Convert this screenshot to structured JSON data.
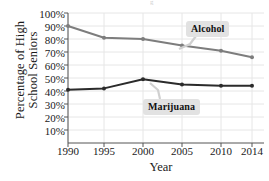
{
  "figure": {
    "top_artifact": "g",
    "background": "#ffffff"
  },
  "chart_data": {
    "type": "line",
    "title": "",
    "xlabel": "Year",
    "ylabel": "Percentage of High School Seniors",
    "x": [
      1990,
      1995,
      2000,
      2005,
      2010,
      2014
    ],
    "xticklabels": [
      "1990",
      "1995",
      "2000",
      "2005",
      "2010",
      "2014"
    ],
    "xlim": [
      1989,
      2015
    ],
    "ylim": [
      0,
      100
    ],
    "yticks": [
      10,
      20,
      30,
      40,
      50,
      60,
      70,
      80,
      90,
      100
    ],
    "yticklabels": [
      "10%",
      "20%",
      "30%",
      "40%",
      "50%",
      "60%",
      "70%",
      "80%",
      "90%",
      "100%"
    ],
    "grid": true,
    "legend": "annotations",
    "series": [
      {
        "name": "Alcohol",
        "color": "#7d7d7d",
        "values": [
          90,
          81,
          80,
          75,
          71,
          66
        ]
      },
      {
        "name": "Marijuana",
        "color": "#2b2b2b",
        "values": [
          41,
          42,
          49,
          45,
          44,
          44
        ]
      }
    ],
    "annotations": [
      {
        "label": "Alcohol",
        "series": "Alcohol"
      },
      {
        "label": "Marijuana",
        "series": "Marijuana"
      }
    ]
  },
  "axis": {
    "x_title": "Year",
    "y_title_line1": "Percentage of High",
    "y_title_line2": "School Seniors"
  }
}
